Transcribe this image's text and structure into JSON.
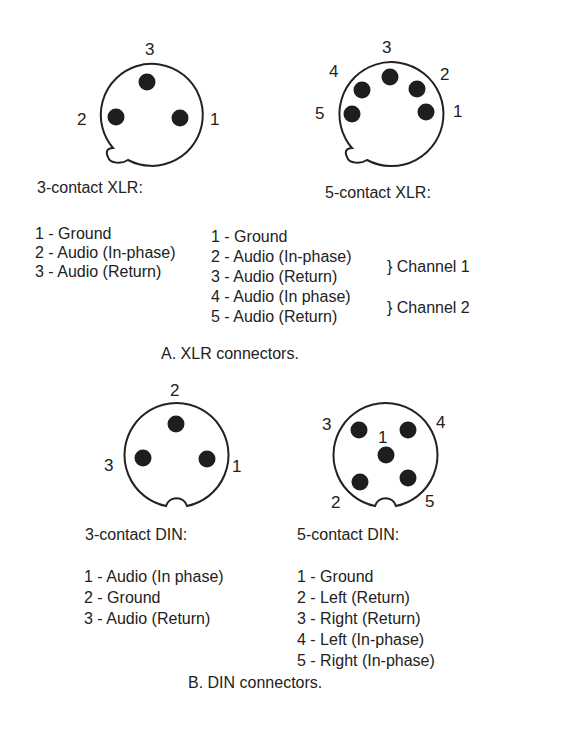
{
  "xlr": {
    "three": {
      "title": "3-contact XLR:",
      "pin_labels": [
        "1",
        "2",
        "3"
      ],
      "pins": [
        "1 - Ground",
        "2 - Audio (In-phase)",
        "3 - Audio (Return)"
      ]
    },
    "five": {
      "title": "5-contact XLR:",
      "pin_labels": [
        "1",
        "2",
        "3",
        "4",
        "5"
      ],
      "pins": [
        "1 - Ground",
        "2 - Audio (In-phase)",
        "3 - Audio (Return)",
        "4 - Audio (In phase)",
        "5 - Audio (Return)"
      ],
      "groups": [
        "} Channel 1",
        "} Channel 2"
      ]
    },
    "caption": "A. XLR connectors."
  },
  "din": {
    "three": {
      "title": "3-contact DIN:",
      "pin_labels": [
        "1",
        "2",
        "3"
      ],
      "pins": [
        "1 - Audio (In phase)",
        "2 - Ground",
        "3 - Audio (Return)"
      ]
    },
    "five": {
      "title": "5-contact DIN:",
      "pin_labels": [
        "1",
        "2",
        "3",
        "4",
        "5"
      ],
      "pins": [
        "1 - Ground",
        "2 - Left (Return)",
        "3 - Right (Return)",
        "4 - Left (In-phase)",
        "5 - Right (In-phase)"
      ]
    },
    "caption": "B. DIN connectors."
  },
  "colors": {
    "ink": "#222222",
    "pin_fill": "#1e1e1e",
    "background": "#ffffff"
  }
}
